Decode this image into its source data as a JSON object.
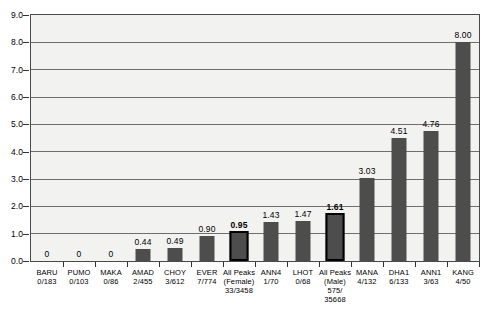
{
  "chart_data": {
    "type": "bar",
    "title": "",
    "xlabel": "",
    "ylabel": "",
    "ylim": [
      0.0,
      9.0
    ],
    "ytick_labels": [
      "0.0",
      "1.0",
      "2.0",
      "3.0",
      "4.0",
      "5.0",
      "6.0",
      "7.0",
      "8.0",
      "9.0"
    ],
    "ytick_values": [
      0.0,
      1.0,
      2.0,
      3.0,
      4.0,
      5.0,
      6.0,
      7.0,
      8.0,
      9.0
    ],
    "grid": true,
    "legend": "none",
    "categories": [
      "BARU",
      "PUMO",
      "MAKA",
      "AMAD",
      "CHOY",
      "EVER",
      "All Peaks (Female)",
      "ANN4",
      "LHOT",
      "All Peaks (Male)",
      "MANA",
      "DHA1",
      "ANN1",
      "KANG"
    ],
    "values": [
      0,
      0,
      0,
      0.44,
      0.49,
      0.9,
      0.95,
      1.43,
      1.47,
      1.61,
      3.03,
      4.51,
      4.76,
      8.0
    ],
    "bars": [
      {
        "name": "BARU",
        "sub": "0/183",
        "value": 0,
        "label": "0",
        "highlight": false,
        "bold": false
      },
      {
        "name": "PUMO",
        "sub": "0/103",
        "value": 0,
        "label": "0",
        "highlight": false,
        "bold": false
      },
      {
        "name": "MAKA",
        "sub": "0/86",
        "value": 0,
        "label": "0",
        "highlight": false,
        "bold": false
      },
      {
        "name": "AMAD",
        "sub": "2/455",
        "value": 0.44,
        "label": "0.44",
        "highlight": false,
        "bold": false
      },
      {
        "name": "CHOY",
        "sub": "3/612",
        "value": 0.49,
        "label": "0.49",
        "highlight": false,
        "bold": false
      },
      {
        "name": "EVER",
        "sub": "7/774",
        "value": 0.9,
        "label": "0.90",
        "highlight": false,
        "bold": false
      },
      {
        "name": "All Peaks",
        "sub2": "(Female)",
        "sub": "33/3458",
        "value": 0.95,
        "label": "0.95",
        "highlight": true,
        "bold": true
      },
      {
        "name": "ANN4",
        "sub": "1/70",
        "value": 1.43,
        "label": "1.43",
        "highlight": false,
        "bold": false
      },
      {
        "name": "LHOT",
        "sub": "0/68",
        "value": 1.47,
        "label": "1.47",
        "highlight": false,
        "bold": false
      },
      {
        "name": "All Peaks",
        "sub2": "(Male)",
        "sub": "575/",
        "sub3": "35668",
        "value": 1.61,
        "label": "1.61",
        "highlight": true,
        "bold": true
      },
      {
        "name": "MANA",
        "sub": "4/132",
        "value": 3.03,
        "label": "3.03",
        "highlight": false,
        "bold": false
      },
      {
        "name": "DHA1",
        "sub": "6/133",
        "value": 4.51,
        "label": "4.51",
        "highlight": false,
        "bold": false
      },
      {
        "name": "ANN1",
        "sub": "3/63",
        "value": 4.76,
        "label": "4.76",
        "highlight": false,
        "bold": false
      },
      {
        "name": "KANG",
        "sub": "4/50",
        "value": 8.0,
        "label": "8.00",
        "highlight": false,
        "bold": false
      }
    ],
    "colors": {
      "bar_fill": "#4d4d4d",
      "bar_highlight_border": "#000000",
      "plot_background": "#f2f2f0",
      "gridline": "#6e6e6e",
      "axis": "#4a4a4a",
      "text": "#000000"
    }
  }
}
